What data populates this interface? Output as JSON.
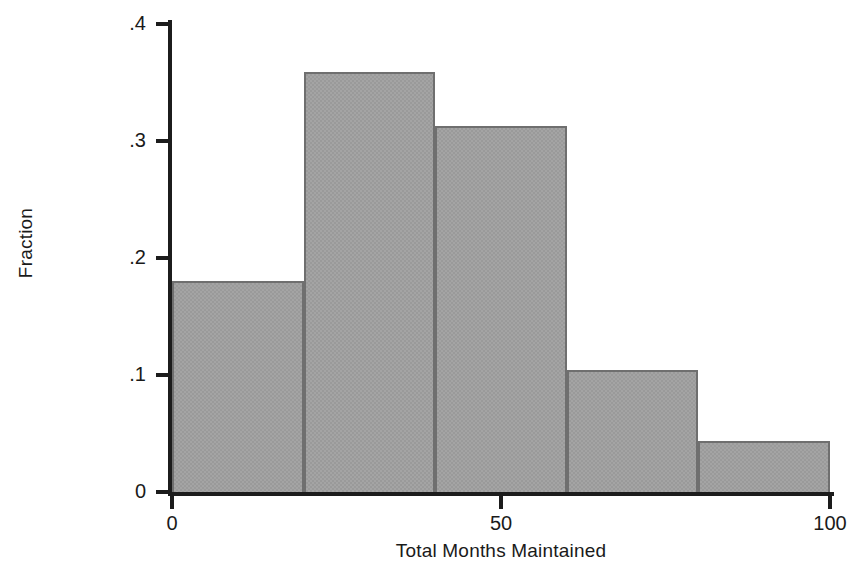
{
  "chart_data": {
    "type": "bar",
    "title": "",
    "subtitle": "",
    "xlabel": "Total Months Maintained",
    "ylabel": "Fraction",
    "categories": [
      "0-20",
      "20-40",
      "40-60",
      "60-80",
      "80-100"
    ],
    "bin_edges": [
      0,
      20,
      40,
      60,
      80,
      100
    ],
    "values": [
      0.18,
      0.359,
      0.313,
      0.104,
      0.044
    ],
    "xlim": [
      0,
      100
    ],
    "ylim": [
      0,
      0.4
    ],
    "xticks": [
      0,
      50,
      100
    ],
    "xticklabels": [
      "0",
      "50",
      "100"
    ],
    "yticks": [
      0,
      0.1,
      0.2,
      0.3,
      0.4
    ],
    "yticklabels": [
      "0",
      ".1",
      ".2",
      ".3",
      ".4"
    ],
    "grid": false,
    "legend": null,
    "bar_fill_color": "#9a9a9a",
    "bar_edge_color": "#6f6f6f",
    "axis_color": "#1c1c1c",
    "background_color": "#ffffff",
    "annotations": []
  }
}
